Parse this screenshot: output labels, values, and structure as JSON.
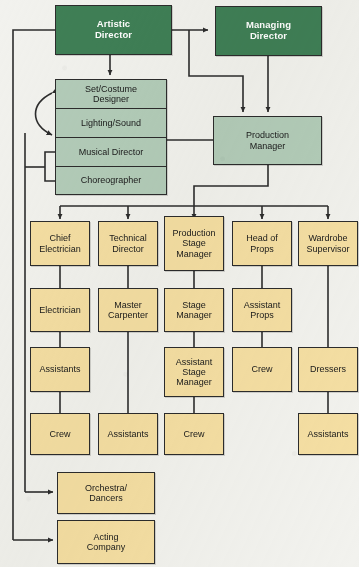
{
  "diagram": {
    "colors": {
      "executive_fill": "#3f7f56",
      "executive_text": "#ffffff",
      "creative_fill": "#b3ccb9",
      "operations_fill": "#f5dfa3",
      "stroke": "#2c2c2c",
      "background": "#f2f2ee"
    },
    "nodes": {
      "artistic_director": "Artistic\nDirector",
      "artistic_director_l1": "Artistic",
      "artistic_director_l2": "Director",
      "managing_director_l1": "Managing",
      "managing_director_l2": "Director",
      "set_costume_designer_l1": "Set/Costume",
      "set_costume_designer_l2": "Designer",
      "lighting_sound": "Lighting/Sound",
      "musical_director": "Musical Director",
      "choreographer": "Choreographer",
      "production_manager_l1": "Production",
      "production_manager_l2": "Manager",
      "chief_electrician_l1": "Chief",
      "chief_electrician_l2": "Electrician",
      "electrician": "Electrician",
      "assistants_col1": "Assistants",
      "crew_col1": "Crew",
      "technical_director_l1": "Technical",
      "technical_director_l2": "Director",
      "master_carpenter_l1": "Master",
      "master_carpenter_l2": "Carpenter",
      "assistants_col2": "Assistants",
      "production_stage_manager_l1": "Production",
      "production_stage_manager_l2": "Stage",
      "production_stage_manager_l3": "Manager",
      "stage_manager_l1": "Stage",
      "stage_manager_l2": "Manager",
      "assistant_stage_manager_l1": "Assistant",
      "assistant_stage_manager_l2": "Stage",
      "assistant_stage_manager_l3": "Manager",
      "crew_col3": "Crew",
      "head_of_props_l1": "Head of",
      "head_of_props_l2": "Props",
      "assistant_props_l1": "Assistant",
      "assistant_props_l2": "Props",
      "crew_col4": "Crew",
      "wardrobe_supervisor_l1": "Wardrobe",
      "wardrobe_supervisor_l2": "Supervisor",
      "dressers": "Dressers",
      "assistants_col5": "Assistants",
      "orchestra_dancers_l1": "Orchestra/",
      "orchestra_dancers_l2": "Dancers",
      "acting_company_l1": "Acting",
      "acting_company_l2": "Company"
    }
  }
}
